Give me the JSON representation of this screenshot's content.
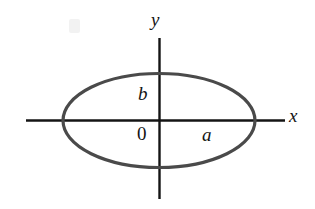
{
  "figure": {
    "background_color": "#ffffff",
    "axis_color": "#141414",
    "curve_color": "#4a4a4a",
    "label_color": "#141414"
  },
  "axes": {
    "x_axis": {
      "label": "x",
      "style": "italic",
      "x_start": 26,
      "x_end": 285,
      "y": 120,
      "stroke_width": 2.4
    },
    "y_axis": {
      "label": "y",
      "style": "italic",
      "x": 159,
      "y_start": 38,
      "y_end": 199,
      "stroke_width": 2.4
    },
    "origin_label": "0"
  },
  "curve": {
    "type": "ellipse",
    "center_x": 159,
    "center_y": 120,
    "semi_axis_x": 96,
    "semi_axis_y": 47,
    "stroke_width": 3.2,
    "fill": "none"
  },
  "labels": {
    "semi_major": "a",
    "semi_minor": "b",
    "origin": "0",
    "x_axis": "x",
    "y_axis": "y"
  },
  "chart_data": {
    "type": "line",
    "title": "",
    "xlabel": "x",
    "ylabel": "y",
    "annotations": [
      "a",
      "b",
      "0"
    ],
    "series": [
      {
        "name": "ellipse",
        "equation": "x^2/a^2 + y^2/b^2 = 1",
        "semi_axis_a": 96,
        "semi_axis_b": 47
      }
    ],
    "grid": false,
    "legend": "none"
  }
}
